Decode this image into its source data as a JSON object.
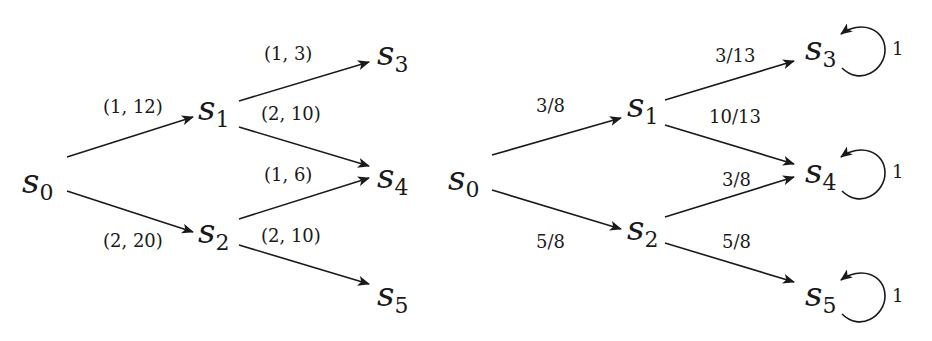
{
  "left_graph": {
    "nodes": [
      {
        "id": "s0",
        "base": "s",
        "sub": "0",
        "x": 22,
        "y": 193
      },
      {
        "id": "s1",
        "base": "s",
        "sub": "1",
        "x": 198,
        "y": 120
      },
      {
        "id": "s2",
        "base": "s",
        "sub": "2",
        "x": 198,
        "y": 243
      },
      {
        "id": "s3",
        "base": "s",
        "sub": "3",
        "x": 377,
        "y": 65
      },
      {
        "id": "s4",
        "base": "s",
        "sub": "4",
        "x": 377,
        "y": 188
      },
      {
        "id": "s5",
        "base": "s",
        "sub": "5",
        "x": 377,
        "y": 306
      }
    ],
    "edges": [
      {
        "from": "s0",
        "to": "s1",
        "label": "(1, 12)",
        "x1": 67,
        "y1": 157,
        "x2": 193,
        "y2": 117,
        "lx": 103,
        "ly": 113
      },
      {
        "from": "s0",
        "to": "s2",
        "label": "(2, 20)",
        "x1": 67,
        "y1": 191,
        "x2": 193,
        "y2": 232,
        "lx": 103,
        "ly": 247
      },
      {
        "from": "s1",
        "to": "s3",
        "label": "(1, 3)",
        "x1": 239,
        "y1": 101,
        "x2": 369,
        "y2": 62,
        "lx": 264,
        "ly": 60
      },
      {
        "from": "s1",
        "to": "s4",
        "label": "(2, 10)",
        "x1": 239,
        "y1": 127,
        "x2": 369,
        "y2": 166,
        "lx": 261,
        "ly": 120
      },
      {
        "from": "s2",
        "to": "s4",
        "label": "(1, 6)",
        "x1": 239,
        "y1": 219,
        "x2": 369,
        "y2": 178,
        "lx": 264,
        "ly": 181
      },
      {
        "from": "s2",
        "to": "s5",
        "label": "(2, 10)",
        "x1": 239,
        "y1": 245,
        "x2": 369,
        "y2": 284,
        "lx": 261,
        "ly": 242
      }
    ]
  },
  "right_graph": {
    "nodes": [
      {
        "id": "s0",
        "base": "s",
        "sub": "0",
        "x": 448,
        "y": 190
      },
      {
        "id": "s1",
        "base": "s",
        "sub": "1",
        "x": 627,
        "y": 117
      },
      {
        "id": "s2",
        "base": "s",
        "sub": "2",
        "x": 627,
        "y": 240
      },
      {
        "id": "s3",
        "base": "s",
        "sub": "3",
        "x": 805,
        "y": 60
      },
      {
        "id": "s4",
        "base": "s",
        "sub": "4",
        "x": 805,
        "y": 183
      },
      {
        "id": "s5",
        "base": "s",
        "sub": "5",
        "x": 805,
        "y": 306
      }
    ],
    "edges": [
      {
        "from": "s0",
        "to": "s1",
        "label": "3/8",
        "x1": 492,
        "y1": 155,
        "x2": 621,
        "y2": 118,
        "lx": 536,
        "ly": 112
      },
      {
        "from": "s0",
        "to": "s2",
        "label": "5/8",
        "x1": 492,
        "y1": 190,
        "x2": 621,
        "y2": 229,
        "lx": 536,
        "ly": 248
      },
      {
        "from": "s1",
        "to": "s3",
        "label": "3/13",
        "x1": 665,
        "y1": 100,
        "x2": 794,
        "y2": 61,
        "lx": 715,
        "ly": 62
      },
      {
        "from": "s1",
        "to": "s4",
        "label": "10/13",
        "x1": 665,
        "y1": 125,
        "x2": 794,
        "y2": 164,
        "lx": 709,
        "ly": 123
      },
      {
        "from": "s2",
        "to": "s4",
        "label": "3/8",
        "x1": 665,
        "y1": 217,
        "x2": 794,
        "y2": 177,
        "lx": 722,
        "ly": 186
      },
      {
        "from": "s2",
        "to": "s5",
        "label": "5/8",
        "x1": 665,
        "y1": 243,
        "x2": 794,
        "y2": 282,
        "lx": 722,
        "ly": 248
      }
    ],
    "self_loops": [
      {
        "node": "s3",
        "label": "1",
        "cx": 845,
        "cy": 50,
        "lx": 892,
        "ly": 55
      },
      {
        "node": "s4",
        "label": "1",
        "cx": 845,
        "cy": 173,
        "lx": 892,
        "ly": 178
      },
      {
        "node": "s5",
        "label": "1",
        "cx": 845,
        "cy": 296,
        "lx": 892,
        "ly": 302
      }
    ]
  }
}
